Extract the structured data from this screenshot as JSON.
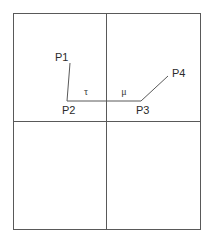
{
  "figure": {
    "type": "line-diagram",
    "background_color": "#ffffff",
    "stroke_color": "#595959",
    "text_color": "#2b2b2b",
    "canvas": {
      "width": 216,
      "height": 239
    },
    "frame": {
      "name": "outer-rectangle",
      "x": 13,
      "y": 13,
      "width": 188,
      "height": 217,
      "stroke_width": 1
    },
    "dividers": [
      {
        "name": "vertical-divider",
        "orientation": "vertical",
        "x": 106,
        "y1": 13,
        "y2": 230
      },
      {
        "name": "horizontal-divider",
        "orientation": "horizontal",
        "y": 121,
        "x1": 13,
        "x2": 201
      }
    ],
    "polyline": {
      "name": "p1-p2-p3-p4-path",
      "points": "70,63 67,101 141,101 168,76",
      "stroke_width": 1
    },
    "vertices": [
      {
        "id": "P1",
        "label": "P1",
        "x": 70,
        "y": 63,
        "label_x": 55,
        "label_y": 61
      },
      {
        "id": "P2",
        "label": "P2",
        "x": 67,
        "y": 101,
        "label_x": 62,
        "label_y": 114
      },
      {
        "id": "P3",
        "label": "P3",
        "x": 141,
        "y": 101,
        "label_x": 136,
        "label_y": 114
      },
      {
        "id": "P4",
        "label": "P4",
        "x": 168,
        "y": 76,
        "label_x": 172,
        "label_y": 77
      }
    ],
    "angle_labels": [
      {
        "id": "tau",
        "label": "τ",
        "x": 86,
        "y": 95
      },
      {
        "id": "mu",
        "label": "μ",
        "x": 124,
        "y": 95
      }
    ]
  }
}
